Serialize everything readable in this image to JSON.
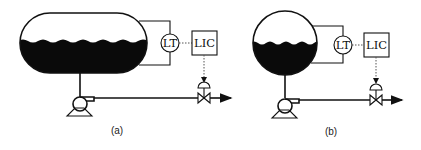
{
  "diagrams": [
    {
      "id": "a",
      "caption": "(a)",
      "vessel_type": "horizontal-cylindrical-tank",
      "transmitter_label": "LT",
      "controller_label": "LIC"
    },
    {
      "id": "b",
      "caption": "(b)",
      "vessel_type": "spherical-tank",
      "transmitter_label": "LT",
      "controller_label": "LIC"
    }
  ],
  "colors": {
    "line": "#111111",
    "liquid": "#0a0a0a",
    "signal": "#555555",
    "background": "#ffffff"
  }
}
